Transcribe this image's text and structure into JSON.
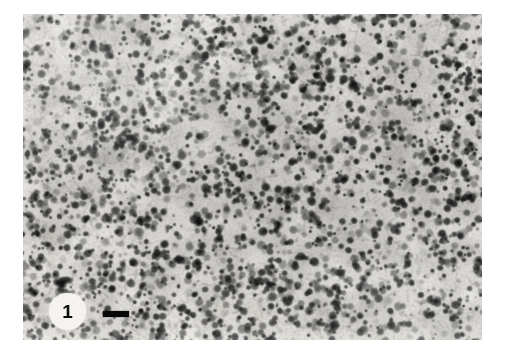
{
  "figure": {
    "kind": "photomicrograph-plate",
    "panel_label": "1",
    "page_background": "#ffffff",
    "panel": {
      "name": "histological-section",
      "description": "Dense cellular tissue section with numerous dark-stained nuclei on a lighter eosinophilic background",
      "frame": {
        "x": 23,
        "y": 14,
        "width": 459,
        "height": 326
      },
      "tone": {
        "background_light": "#e8e6e1",
        "background_mid": "#b9b6b0",
        "nucleus_dark": "#1a1a1a",
        "nucleus_mid": "#4a4a4a",
        "highlight": "#f6f5f2"
      }
    },
    "scale_bar": {
      "name": "scale-bar",
      "label": "",
      "x": 103,
      "y": 311,
      "width": 26,
      "height": 6,
      "color": "#080808"
    },
    "label_disc": {
      "x": 49,
      "y": 293,
      "diameter": 37,
      "fill": "#f4f3f0",
      "text_color": "#0d0d0d"
    }
  },
  "texture": {
    "seed": 20240917,
    "nuclei_count": 2600,
    "nucleus_radius_min": 1.6,
    "nucleus_radius_max": 4.6,
    "grain_amount": 0.22,
    "blur": 0.6
  }
}
